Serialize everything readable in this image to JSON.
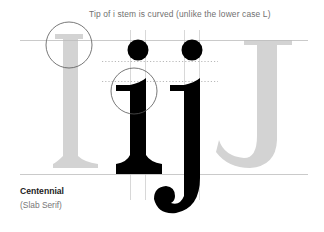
{
  "diagram": {
    "caption": "Tip of i stem is curved (unlike the lower case L)",
    "font_name": "Centennial",
    "font_class": "(Slab Serif)",
    "glyphs": [
      "I",
      "i",
      "j",
      "J"
    ],
    "colors": {
      "ghost_glyph": "#d0d0d0",
      "solid_glyph": "#000000",
      "guide_line": "#bdbdbd",
      "highlight_circle": "#555555",
      "dotted_line": "#8a8a8a"
    }
  }
}
